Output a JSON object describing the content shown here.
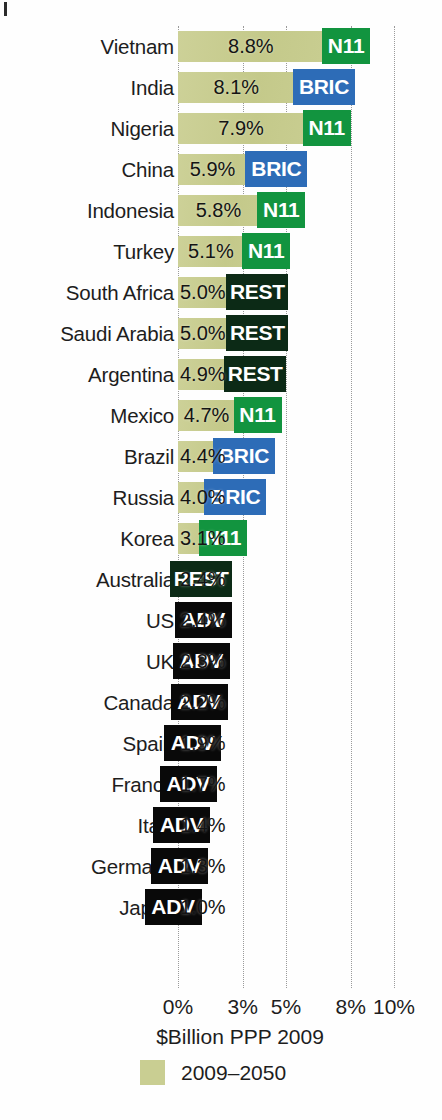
{
  "chart_data": {
    "type": "bar",
    "orientation": "horizontal",
    "title": "",
    "xlabel": "$Billion PPP 2009",
    "ylabel": "",
    "xlim": [
      0,
      10.4
    ],
    "grid": true,
    "gridlines_dotted": true,
    "xticks": [
      "0%",
      "3%",
      "5%",
      "8%",
      "10%"
    ],
    "xtick_values": [
      0,
      3,
      5,
      8,
      10
    ],
    "legend": {
      "position": "bottom-left",
      "entries": [
        {
          "label": "2009–2050",
          "color": "#c9ce92"
        }
      ]
    },
    "group_colors": {
      "N11": "#12943f",
      "BRIC": "#2d6cb7",
      "REST": "#0c2a16",
      "ADV": "#090909"
    },
    "bar_color": "#c9ce92",
    "categories": [
      "Vietnam",
      "India",
      "Nigeria",
      "China",
      "Indonesia",
      "Turkey",
      "South Africa",
      "Saudi Arabia",
      "Argentina",
      "Mexico",
      "Brazil",
      "Russia",
      "Korea",
      "Australia",
      "US",
      "UK",
      "Canada",
      "Spain",
      "France",
      "Italy",
      "Germany",
      "Japan"
    ],
    "values": [
      8.8,
      8.1,
      7.9,
      5.9,
      5.8,
      5.1,
      5.0,
      5.0,
      4.9,
      4.7,
      4.4,
      4.0,
      3.1,
      2.4,
      2.4,
      2.3,
      2.2,
      1.9,
      1.7,
      1.4,
      1.3,
      1.0
    ],
    "value_labels": [
      "8.8%",
      "8.1%",
      "7.9%",
      "5.9%",
      "5.8%",
      "5.1%",
      "5.0%",
      "5.0%",
      "4.9%",
      "4.7%",
      "4.4%",
      "4.0%",
      "3.1%",
      "2.4%",
      "2.4%",
      "2.3%",
      "2.2%",
      "1.9%",
      "1.7%",
      "1.4%",
      "1.3%",
      "1.0%"
    ],
    "groups": [
      "N11",
      "BRIC",
      "N11",
      "BRIC",
      "N11",
      "N11",
      "REST",
      "REST",
      "REST",
      "N11",
      "BRIC",
      "BRIC",
      "N11",
      "REST",
      "ADV",
      "ADV",
      "ADV",
      "ADV",
      "ADV",
      "ADV",
      "ADV",
      "ADV"
    ],
    "rows": [
      {
        "country": "Vietnam",
        "value": 8.8,
        "value_label": "8.8%",
        "group": "N11"
      },
      {
        "country": "India",
        "value": 8.1,
        "value_label": "8.1%",
        "group": "BRIC"
      },
      {
        "country": "Nigeria",
        "value": 7.9,
        "value_label": "7.9%",
        "group": "N11"
      },
      {
        "country": "China",
        "value": 5.9,
        "value_label": "5.9%",
        "group": "BRIC"
      },
      {
        "country": "Indonesia",
        "value": 5.8,
        "value_label": "5.8%",
        "group": "N11"
      },
      {
        "country": "Turkey",
        "value": 5.1,
        "value_label": "5.1%",
        "group": "N11"
      },
      {
        "country": "South Africa",
        "value": 5.0,
        "value_label": "5.0%",
        "group": "REST"
      },
      {
        "country": "Saudi Arabia",
        "value": 5.0,
        "value_label": "5.0%",
        "group": "REST"
      },
      {
        "country": "Argentina",
        "value": 4.9,
        "value_label": "4.9%",
        "group": "REST"
      },
      {
        "country": "Mexico",
        "value": 4.7,
        "value_label": "4.7%",
        "group": "N11"
      },
      {
        "country": "Brazil",
        "value": 4.4,
        "value_label": "4.4%",
        "group": "BRIC"
      },
      {
        "country": "Russia",
        "value": 4.0,
        "value_label": "4.0%",
        "group": "BRIC"
      },
      {
        "country": "Korea",
        "value": 3.1,
        "value_label": "3.1%",
        "group": "N11"
      },
      {
        "country": "Australia",
        "value": 2.4,
        "value_label": "2.4%",
        "group": "REST"
      },
      {
        "country": "US",
        "value": 2.4,
        "value_label": "2.4%",
        "group": "ADV"
      },
      {
        "country": "UK",
        "value": 2.3,
        "value_label": "2.3%",
        "group": "ADV"
      },
      {
        "country": "Canada",
        "value": 2.2,
        "value_label": "2.2%",
        "group": "ADV"
      },
      {
        "country": "Spain",
        "value": 1.9,
        "value_label": "1.9%",
        "group": "ADV"
      },
      {
        "country": "France",
        "value": 1.7,
        "value_label": "1.7%",
        "group": "ADV"
      },
      {
        "country": "Italy",
        "value": 1.4,
        "value_label": "1.4%",
        "group": "ADV"
      },
      {
        "country": "Germany",
        "value": 1.3,
        "value_label": "1.3%",
        "group": "ADV"
      },
      {
        "country": "Japan",
        "value": 1.0,
        "value_label": "1.0%",
        "group": "ADV"
      }
    ]
  }
}
